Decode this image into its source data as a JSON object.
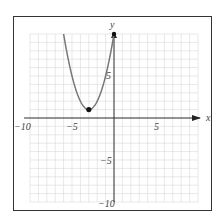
{
  "chart_data": {
    "type": "line",
    "title": "",
    "xlabel": "x",
    "ylabel": "y",
    "xlim": [
      -10,
      10
    ],
    "ylim": [
      -10,
      10
    ],
    "grid": true,
    "x_ticks": [
      "-10",
      "-5",
      "5"
    ],
    "y_ticks": [
      "5",
      "-5",
      "-10"
    ],
    "series": [
      {
        "name": "parabola",
        "equation": "y = (x + 3)^2 + 1",
        "domain": [
          -6,
          0
        ],
        "color": "#777777",
        "points": [
          [
            -6,
            10
          ],
          [
            -5,
            5
          ],
          [
            -4,
            2
          ],
          [
            -3,
            1
          ],
          [
            -2,
            2
          ],
          [
            -1,
            5
          ],
          [
            0,
            10
          ]
        ]
      }
    ],
    "marked_points": [
      {
        "label": "vertex",
        "x": -3,
        "y": 1,
        "style": "closed"
      },
      {
        "label": "endpoint",
        "x": 0,
        "y": 10,
        "style": "closed"
      }
    ]
  },
  "labels": {
    "x_axis": "x",
    "y_axis": "y",
    "x_neg10": "−10",
    "x_neg5": "−5",
    "x_5": "5",
    "y_5": "5",
    "y_neg5": "−5",
    "y_neg10": "−10"
  }
}
